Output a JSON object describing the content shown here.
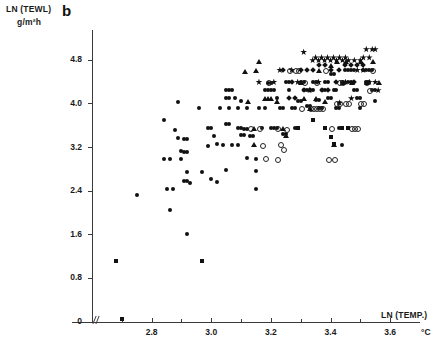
{
  "figure": {
    "panel_letter": "b",
    "y_axis_title": "LN (TEWL)",
    "y_axis_unit": "g/m²h",
    "x_axis_title": "LN (TEMP.)",
    "x_axis_unit": "°C"
  },
  "chart_data": {
    "type": "scatter",
    "title": "b",
    "xlabel": "LN (TEMP.)",
    "ylabel": "LN (TEWL)",
    "x_unit": "°C",
    "y_unit": "g/m²h",
    "xlim": [
      2.6,
      3.68
    ],
    "ylim": [
      0,
      5.3
    ],
    "grid": false,
    "legend": "none",
    "x_ticks": [
      2.8,
      3.0,
      3.2,
      3.4,
      3.6
    ],
    "x_tick_labels": [
      "2.8",
      "3.0",
      "3.2",
      "3.4",
      "3.6"
    ],
    "x_minor_ticks": [
      2.7,
      2.9,
      3.1,
      3.3,
      3.5
    ],
    "y_ticks": [
      0,
      0.8,
      1.6,
      2.4,
      3.2,
      4.0,
      4.8
    ],
    "y_tick_labels": [
      "0",
      "0.8",
      "1.6",
      "2.4",
      "3.2",
      "4.0",
      "4.8"
    ],
    "axis_break_on_x": true,
    "marker_types": [
      "circle-filled",
      "circle-open",
      "triangle-filled",
      "square-filled",
      "diamond-filled",
      "star-filled"
    ],
    "series": [
      {
        "name": "circle-filled",
        "marker": "circle-filled",
        "points": [
          [
            2.75,
            2.33
          ],
          [
            2.84,
            3.7
          ],
          [
            2.84,
            2.99
          ],
          [
            2.86,
            2.99
          ],
          [
            2.85,
            2.43
          ],
          [
            2.87,
            2.43
          ],
          [
            2.86,
            2.05
          ],
          [
            2.88,
            3.53
          ],
          [
            2.89,
            4.03
          ],
          [
            2.89,
            3.37
          ],
          [
            2.9,
            2.99
          ],
          [
            2.9,
            3.14
          ],
          [
            2.91,
            3.12
          ],
          [
            2.92,
            3.12
          ],
          [
            2.91,
            3.36
          ],
          [
            2.92,
            3.36
          ],
          [
            2.92,
            2.76
          ],
          [
            2.91,
            2.58
          ],
          [
            2.92,
            2.58
          ],
          [
            2.93,
            2.55
          ],
          [
            2.92,
            1.62
          ],
          [
            2.96,
            3.92
          ],
          [
            2.97,
            2.76
          ],
          [
            2.99,
            3.23
          ],
          [
            2.99,
            3.55
          ],
          [
            3.0,
            3.55
          ],
          [
            3.0,
            2.62
          ],
          [
            3.01,
            3.42
          ],
          [
            3.02,
            3.27
          ],
          [
            3.02,
            2.57
          ],
          [
            3.03,
            3.92
          ],
          [
            3.04,
            3.25
          ],
          [
            3.05,
            4.25
          ],
          [
            3.06,
            4.25
          ],
          [
            3.07,
            4.25
          ],
          [
            3.05,
            3.63
          ],
          [
            3.06,
            3.63
          ],
          [
            3.05,
            4.1
          ],
          [
            3.06,
            4.1
          ],
          [
            3.05,
            2.78
          ],
          [
            3.06,
            3.92
          ],
          [
            3.07,
            3.25
          ],
          [
            3.08,
            4.11
          ],
          [
            3.09,
            3.92
          ],
          [
            3.09,
            3.55
          ],
          [
            3.1,
            3.55
          ],
          [
            3.09,
            3.25
          ],
          [
            3.1,
            3.43
          ],
          [
            3.11,
            3.43
          ],
          [
            3.1,
            4.05
          ],
          [
            3.11,
            3.54
          ],
          [
            3.12,
            3.54
          ],
          [
            3.12,
            3.92
          ],
          [
            3.12,
            3.0
          ],
          [
            3.13,
            3.42
          ],
          [
            3.14,
            3.42
          ],
          [
            3.15,
            2.99
          ],
          [
            3.15,
            2.77
          ],
          [
            3.15,
            2.43
          ],
          [
            3.16,
            3.92
          ],
          [
            3.17,
            3.55
          ],
          [
            3.18,
            3.92
          ],
          [
            3.18,
            4.25
          ],
          [
            3.19,
            4.25
          ],
          [
            3.2,
            4.25
          ],
          [
            3.21,
            4.25
          ],
          [
            3.19,
            4.39
          ],
          [
            3.2,
            4.39
          ],
          [
            3.2,
            3.55
          ],
          [
            3.21,
            3.55
          ],
          [
            3.22,
            3.55
          ],
          [
            3.22,
            4.1
          ],
          [
            3.23,
            3.92
          ],
          [
            3.24,
            3.92
          ],
          [
            3.24,
            3.45
          ],
          [
            3.25,
            3.45
          ],
          [
            3.25,
            4.4
          ],
          [
            3.26,
            4.4
          ],
          [
            3.26,
            4.25
          ],
          [
            3.27,
            3.92
          ],
          [
            3.28,
            3.92
          ],
          [
            3.28,
            3.55
          ],
          [
            3.29,
            3.55
          ],
          [
            3.29,
            4.05
          ],
          [
            3.3,
            4.05
          ],
          [
            3.3,
            4.4
          ],
          [
            3.31,
            4.4
          ],
          [
            3.31,
            4.25
          ],
          [
            3.32,
            4.25
          ],
          [
            3.32,
            3.97
          ],
          [
            3.33,
            3.97
          ],
          [
            3.33,
            4.25
          ],
          [
            3.34,
            4.25
          ],
          [
            3.34,
            4.4
          ],
          [
            3.35,
            4.4
          ],
          [
            3.35,
            4.08
          ],
          [
            3.36,
            4.08
          ],
          [
            3.36,
            3.92
          ],
          [
            3.37,
            3.92
          ],
          [
            3.37,
            4.25
          ],
          [
            3.38,
            4.25
          ],
          [
            3.38,
            4.4
          ],
          [
            3.39,
            4.4
          ],
          [
            3.39,
            4.11
          ],
          [
            3.4,
            4.11
          ],
          [
            3.4,
            4.54
          ],
          [
            3.41,
            4.54
          ],
          [
            3.41,
            4.25
          ],
          [
            3.42,
            4.25
          ],
          [
            3.42,
            3.92
          ],
          [
            3.43,
            3.92
          ],
          [
            3.43,
            3.55
          ],
          [
            3.44,
            4.4
          ],
          [
            3.44,
            3.25
          ],
          [
            3.45,
            4.62
          ],
          [
            3.46,
            4.62
          ],
          [
            3.47,
            4.62
          ],
          [
            3.48,
            4.62
          ],
          [
            3.46,
            4.4
          ],
          [
            3.47,
            4.4
          ],
          [
            3.48,
            4.25
          ],
          [
            3.49,
            4.25
          ],
          [
            3.49,
            4.1
          ],
          [
            3.5,
            4.1
          ],
          [
            3.5,
            3.92
          ],
          [
            3.51,
            4.62
          ],
          [
            3.52,
            4.62
          ],
          [
            3.53,
            4.62
          ],
          [
            3.54,
            4.62
          ],
          [
            3.52,
            4.4
          ],
          [
            3.53,
            4.4
          ],
          [
            3.54,
            4.25
          ],
          [
            3.55,
            4.25
          ],
          [
            3.55,
            4.05
          ]
        ]
      },
      {
        "name": "circle-open",
        "marker": "circle-open",
        "points": [
          [
            3.13,
            3.55
          ],
          [
            3.16,
            3.55
          ],
          [
            3.17,
            3.25
          ],
          [
            3.18,
            3.0
          ],
          [
            3.19,
            4.4
          ],
          [
            3.22,
            3.55
          ],
          [
            3.23,
            3.27
          ],
          [
            3.24,
            3.18
          ],
          [
            3.22,
            2.99
          ],
          [
            3.25,
            3.54
          ],
          [
            3.26,
            4.62
          ],
          [
            3.28,
            4.62
          ],
          [
            3.29,
            4.62
          ],
          [
            3.3,
            3.92
          ],
          [
            3.31,
            4.4
          ],
          [
            3.33,
            3.92
          ],
          [
            3.34,
            3.92
          ],
          [
            3.35,
            4.4
          ],
          [
            3.37,
            3.92
          ],
          [
            3.38,
            4.62
          ],
          [
            3.4,
            3.55
          ],
          [
            3.41,
            2.99
          ],
          [
            3.43,
            4.4
          ],
          [
            3.44,
            4.4
          ],
          [
            3.45,
            4.02
          ],
          [
            3.46,
            4.02
          ],
          [
            3.47,
            3.55
          ],
          [
            3.48,
            3.55
          ],
          [
            3.5,
            4.02
          ],
          [
            3.51,
            4.02
          ],
          [
            3.52,
            4.4
          ],
          [
            3.53,
            4.25
          ],
          [
            3.54,
            4.62
          ],
          [
            3.49,
            3.55
          ],
          [
            3.35,
            3.92
          ],
          [
            3.36,
            3.92
          ],
          [
            3.42,
            4.02
          ],
          [
            3.43,
            4.02
          ],
          [
            3.39,
            2.99
          ]
        ]
      },
      {
        "name": "triangle-filled",
        "marker": "triangle-filled",
        "points": [
          [
            3.11,
            4.6
          ],
          [
            3.12,
            4.05
          ],
          [
            3.14,
            3.55
          ],
          [
            3.14,
            3.25
          ],
          [
            3.15,
            4.62
          ],
          [
            3.16,
            4.78
          ],
          [
            3.18,
            4.1
          ],
          [
            3.19,
            4.1
          ],
          [
            3.2,
            4.1
          ],
          [
            3.22,
            4.05
          ],
          [
            3.24,
            3.55
          ],
          [
            3.25,
            3.42
          ],
          [
            3.31,
            4.1
          ],
          [
            3.33,
            3.92
          ],
          [
            3.35,
            4.1
          ],
          [
            3.36,
            4.62
          ],
          [
            3.38,
            4.05
          ],
          [
            3.4,
            4.7
          ],
          [
            3.42,
            4.78
          ],
          [
            3.44,
            4.4
          ],
          [
            3.45,
            4.78
          ],
          [
            3.47,
            4.4
          ],
          [
            3.5,
            4.78
          ],
          [
            3.52,
            4.4
          ],
          [
            3.54,
            4.78
          ],
          [
            3.56,
            4.4
          ],
          [
            3.41,
            3.25
          ],
          [
            3.3,
            4.4
          ]
        ]
      },
      {
        "name": "square-filled",
        "marker": "square-filled",
        "points": [
          [
            2.68,
            1.12
          ],
          [
            2.7,
            0.05
          ],
          [
            2.97,
            1.12
          ],
          [
            3.4,
            3.4
          ],
          [
            3.41,
            3.27
          ],
          [
            3.38,
            3.55
          ],
          [
            3.44,
            3.55
          ],
          [
            3.46,
            3.55
          ],
          [
            3.29,
            3.55
          ],
          [
            3.34,
            3.7
          ]
        ]
      },
      {
        "name": "diamond-filled",
        "marker": "diamond-filled",
        "points": [
          [
            3.24,
            4.62
          ],
          [
            3.27,
            4.4
          ],
          [
            3.3,
            4.62
          ],
          [
            3.32,
            4.62
          ],
          [
            3.34,
            4.62
          ],
          [
            3.36,
            4.72
          ],
          [
            3.38,
            4.72
          ],
          [
            3.4,
            4.62
          ],
          [
            3.43,
            4.62
          ],
          [
            3.45,
            4.72
          ],
          [
            3.47,
            4.72
          ],
          [
            3.49,
            4.72
          ],
          [
            3.51,
            4.72
          ],
          [
            3.31,
            4.25
          ],
          [
            3.33,
            4.25
          ],
          [
            3.37,
            4.25
          ],
          [
            3.39,
            4.25
          ],
          [
            3.42,
            4.4
          ],
          [
            3.48,
            4.4
          ],
          [
            3.26,
            4.1
          ],
          [
            3.28,
            4.1
          ]
        ]
      },
      {
        "name": "star-filled",
        "marker": "star-filled",
        "points": [
          [
            3.16,
            4.4
          ],
          [
            3.21,
            4.4
          ],
          [
            3.23,
            4.62
          ],
          [
            3.27,
            4.62
          ],
          [
            3.29,
            4.4
          ],
          [
            3.31,
            4.95
          ],
          [
            3.35,
            4.85
          ],
          [
            3.37,
            4.85
          ],
          [
            3.39,
            4.85
          ],
          [
            3.41,
            4.85
          ],
          [
            3.43,
            4.85
          ],
          [
            3.45,
            4.85
          ],
          [
            3.34,
            4.8
          ],
          [
            3.36,
            4.8
          ],
          [
            3.38,
            4.8
          ],
          [
            3.4,
            4.8
          ],
          [
            3.42,
            4.8
          ],
          [
            3.44,
            4.8
          ],
          [
            3.46,
            4.8
          ],
          [
            3.48,
            4.8
          ],
          [
            3.5,
            4.8
          ],
          [
            3.52,
            5.0
          ],
          [
            3.54,
            5.0
          ],
          [
            3.55,
            5.0
          ],
          [
            3.53,
            4.85
          ],
          [
            3.51,
            4.85
          ],
          [
            3.49,
            4.62
          ],
          [
            3.51,
            4.62
          ],
          [
            3.53,
            4.4
          ],
          [
            3.55,
            4.4
          ],
          [
            3.56,
            4.25
          ],
          [
            3.47,
            4.1
          ],
          [
            3.43,
            4.02
          ],
          [
            3.36,
            4.4
          ],
          [
            3.45,
            4.4
          ],
          [
            3.33,
            4.25
          ]
        ]
      }
    ]
  }
}
